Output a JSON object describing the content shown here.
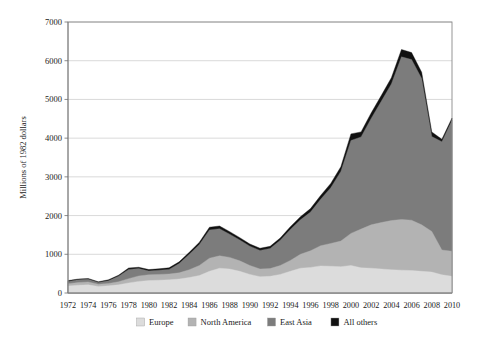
{
  "chart_data": {
    "type": "area",
    "title": "",
    "subtitle": "",
    "xlabel": "",
    "ylabel": "Millions of 1982 dollars",
    "xlim": [
      1972,
      2010
    ],
    "ylim": [
      0,
      7000
    ],
    "grid": true,
    "stacked": true,
    "legend_position": "bottom",
    "x": [
      1972,
      1973,
      1974,
      1975,
      1976,
      1977,
      1978,
      1979,
      1980,
      1981,
      1982,
      1983,
      1984,
      1985,
      1986,
      1987,
      1988,
      1989,
      1990,
      1991,
      1992,
      1993,
      1994,
      1995,
      1996,
      1997,
      1998,
      1999,
      2000,
      2001,
      2002,
      2003,
      2004,
      2005,
      2006,
      2007,
      2008,
      2009,
      2010
    ],
    "xtick_labels": [
      "1972",
      "1974",
      "1976",
      "1978",
      "1980",
      "1982",
      "1984",
      "1986",
      "1988",
      "1990",
      "1992",
      "1994",
      "1996",
      "1998",
      "2000",
      "2002",
      "2004",
      "2006",
      "2008",
      "2010"
    ],
    "ytick_labels": [
      "0",
      "1000",
      "2000",
      "3000",
      "4000",
      "5000",
      "6000",
      "7000"
    ],
    "ytick_values": [
      0,
      1000,
      2000,
      3000,
      4000,
      5000,
      6000,
      7000
    ],
    "series": [
      {
        "name": "Europe",
        "color": "#dcdcdc",
        "values": [
          180,
          200,
          210,
          170,
          185,
          210,
          260,
          300,
          320,
          330,
          340,
          360,
          400,
          450,
          560,
          640,
          620,
          560,
          480,
          420,
          430,
          480,
          560,
          640,
          660,
          700,
          690,
          680,
          710,
          650,
          640,
          620,
          600,
          590,
          580,
          560,
          540,
          470,
          430
        ]
      },
      {
        "name": "North America",
        "color": "#b3b3b3",
        "values": [
          60,
          70,
          75,
          55,
          60,
          80,
          110,
          140,
          150,
          150,
          150,
          160,
          200,
          260,
          340,
          320,
          300,
          270,
          230,
          200,
          200,
          230,
          280,
          360,
          430,
          520,
          590,
          660,
          830,
          1000,
          1120,
          1200,
          1270,
          1310,
          1300,
          1200,
          1050,
          640,
          650
        ]
      },
      {
        "name": "East Asia",
        "color": "#7c7c7c",
        "values": [
          60,
          70,
          70,
          45,
          70,
          140,
          240,
          190,
          100,
          110,
          120,
          240,
          400,
          540,
          730,
          700,
          600,
          540,
          500,
          480,
          520,
          650,
          800,
          890,
          1000,
          1200,
          1440,
          1800,
          2400,
          2380,
          2750,
          3130,
          3530,
          4200,
          4150,
          3780,
          2450,
          2800,
          3380
        ]
      },
      {
        "name": "All others",
        "color": "#111111",
        "values": [
          20,
          20,
          20,
          20,
          25,
          30,
          35,
          35,
          35,
          35,
          40,
          45,
          50,
          60,
          70,
          70,
          65,
          60,
          55,
          55,
          55,
          60,
          70,
          80,
          90,
          100,
          110,
          120,
          170,
          130,
          140,
          150,
          160,
          190,
          180,
          160,
          120,
          60,
          60
        ]
      }
    ],
    "totals_note": "",
    "peak": {
      "year": 2005,
      "value": 6240
    },
    "trough_after_peak": {
      "year": 2009,
      "value": 3970
    }
  },
  "legend": {
    "items": [
      {
        "label": "Europe",
        "color": "#dcdcdc"
      },
      {
        "label": "North America",
        "color": "#b3b3b3"
      },
      {
        "label": "East Asia",
        "color": "#7c7c7c"
      },
      {
        "label": "All others",
        "color": "#111111"
      }
    ]
  }
}
